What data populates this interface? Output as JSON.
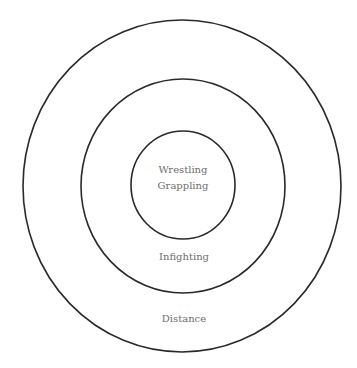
{
  "diagram": {
    "type": "concentric-circles",
    "colors": {
      "stroke": "#2a2a2a",
      "text": "#6e6e6e",
      "background": "#ffffff"
    },
    "rings": [
      {
        "name": "inner",
        "labels": [
          "Wrestling",
          "Grappling"
        ]
      },
      {
        "name": "middle",
        "labels": [
          "Infighting"
        ]
      },
      {
        "name": "outer",
        "labels": [
          "Distance"
        ]
      }
    ]
  }
}
